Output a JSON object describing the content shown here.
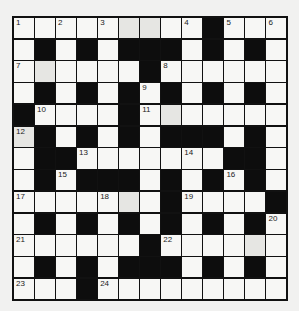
{
  "puzzle": {
    "rows": 13,
    "cols": 13,
    "layout": [
      ".........#...",
      ".#.#.###.#.#.",
      "......#......",
      ".#.#.#.#.#.#.",
      "#....#.......",
      ".#.#.#.###.#.",
      ".##.......##.",
      ".#.###.#.#.#.",
      ".......#....#",
      ".#.#.#.#.#.#.",
      "......#......",
      ".#.#.###.#.#.",
      "...#........."
    ],
    "numbers": [
      {
        "n": "1",
        "r": 0,
        "c": 0
      },
      {
        "n": "2",
        "r": 0,
        "c": 2
      },
      {
        "n": "3",
        "r": 0,
        "c": 4
      },
      {
        "n": "4",
        "r": 0,
        "c": 8
      },
      {
        "n": "5",
        "r": 0,
        "c": 10
      },
      {
        "n": "6",
        "r": 0,
        "c": 12
      },
      {
        "n": "7",
        "r": 2,
        "c": 0
      },
      {
        "n": "8",
        "r": 2,
        "c": 7
      },
      {
        "n": "9",
        "r": 3,
        "c": 6
      },
      {
        "n": "10",
        "r": 4,
        "c": 1
      },
      {
        "n": "11",
        "r": 4,
        "c": 6
      },
      {
        "n": "12",
        "r": 5,
        "c": 0
      },
      {
        "n": "13",
        "r": 6,
        "c": 3
      },
      {
        "n": "14",
        "r": 6,
        "c": 8
      },
      {
        "n": "15",
        "r": 7,
        "c": 2
      },
      {
        "n": "16",
        "r": 7,
        "c": 10
      },
      {
        "n": "17",
        "r": 8,
        "c": 0
      },
      {
        "n": "18",
        "r": 8,
        "c": 4
      },
      {
        "n": "19",
        "r": 8,
        "c": 8
      },
      {
        "n": "20",
        "r": 9,
        "c": 12
      },
      {
        "n": "21",
        "r": 10,
        "c": 0
      },
      {
        "n": "22",
        "r": 10,
        "c": 7
      },
      {
        "n": "23",
        "r": 12,
        "c": 0
      },
      {
        "n": "24",
        "r": 12,
        "c": 4
      }
    ],
    "shaded": [
      [
        0,
        5
      ],
      [
        0,
        6
      ],
      [
        2,
        1
      ],
      [
        5,
        0
      ],
      [
        8,
        5
      ],
      [
        10,
        11
      ],
      [
        4,
        7
      ]
    ]
  }
}
